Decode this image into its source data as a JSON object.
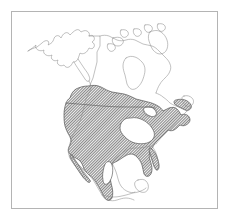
{
  "figure": {
    "type": "distribution-map",
    "region": "North America",
    "background_color": "#ffffff",
    "frame": {
      "color": "#b4b4b4",
      "x": 11,
      "y": 11,
      "width": 207,
      "height": 198,
      "line_width": 1
    },
    "coastline": {
      "color": "#8d8d8d",
      "line_width": 0.55,
      "label": "coastline-and-political-outline"
    },
    "political_border": {
      "color": "#555555",
      "line_width": 0.6,
      "label": "us-canada-border"
    },
    "range": {
      "label": "species-distribution-range",
      "fill_pattern": "diagonal-hatch",
      "hatch_color": "#8a8a8a",
      "hatch_background": "#ffffff",
      "effective_gray": "#9a9a9a",
      "outline_color": "#4a4a4a",
      "coverage": [
        "contiguous-united-states",
        "southern-canada",
        "mexico",
        "baja-california",
        "eastern-seaboard",
        "florida-peninsula",
        "maritime-provinces"
      ],
      "gaps": [
        "southeastern-united-states-interior",
        "central-mexican-plateau",
        "great-lakes"
      ]
    },
    "landmasses": [
      "alaska",
      "canada",
      "arctic-archipelago",
      "hudson-bay",
      "united-states",
      "mexico",
      "central-america",
      "baja-california",
      "newfoundland",
      "great-lakes"
    ]
  }
}
